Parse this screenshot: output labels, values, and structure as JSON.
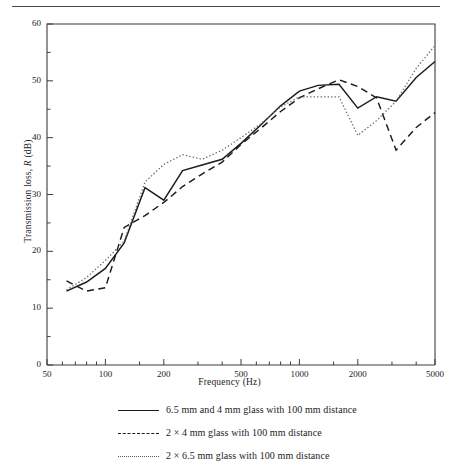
{
  "figure": {
    "has_top_rule": true
  },
  "chart_data": {
    "type": "line",
    "title": "",
    "xlabel": "Frequency (Hz)",
    "ylabel": "Transmission loss, R (dB)",
    "xscale": "log",
    "xlim": [
      50,
      5000
    ],
    "ylim": [
      0,
      60
    ],
    "grid": false,
    "legend_position": "below",
    "xticks": [
      50,
      100,
      200,
      500,
      1000,
      2000,
      5000
    ],
    "xtick_labels": [
      "50",
      "100",
      "200",
      "500",
      "1000",
      "2000",
      "5000"
    ],
    "xminor_ticks": [
      60,
      70,
      80,
      90,
      150,
      300,
      400,
      600,
      700,
      800,
      900,
      1500,
      3000,
      4000
    ],
    "yticks": [
      0,
      10,
      20,
      30,
      40,
      50,
      60
    ],
    "ytick_labels": [
      "0",
      "10",
      "20",
      "30",
      "40",
      "50",
      "60"
    ],
    "yminor_ticks": [
      5,
      15,
      25,
      35,
      45,
      55
    ],
    "x": [
      63,
      80,
      100,
      125,
      160,
      200,
      250,
      315,
      400,
      500,
      630,
      800,
      1000,
      1250,
      1600,
      2000,
      2500,
      3150,
      4000,
      5000
    ],
    "series": [
      {
        "name": "6.5 mm and 4 mm glass with 100 mm distance",
        "style": "solid",
        "color": "#1b1b1b",
        "values": [
          13.0,
          14.6,
          17.0,
          21.5,
          31.2,
          29.0,
          34.2,
          35.2,
          36.2,
          39.0,
          42.2,
          45.6,
          48.2,
          49.2,
          49.4,
          45.2,
          47.2,
          46.4,
          50.6,
          53.4
        ]
      },
      {
        "name": "2 × 4 mm glass with 100 mm distance",
        "style": "dashed",
        "color": "#1b1b1b",
        "values": [
          14.8,
          13.0,
          13.6,
          24.2,
          26.3,
          28.6,
          31.4,
          33.6,
          35.7,
          38.8,
          41.6,
          44.6,
          47.0,
          48.6,
          50.2,
          49.0,
          47.0,
          37.8,
          41.8,
          44.4
        ]
      },
      {
        "name": "2 × 6.5 mm glass with 100 mm distance",
        "style": "dotted",
        "color": "#6a6a6a",
        "values": [
          13.2,
          15.4,
          18.4,
          21.8,
          32.2,
          35.3,
          37.0,
          36.2,
          37.8,
          40.0,
          42.4,
          45.4,
          47.2,
          47.2,
          47.2,
          40.4,
          43.0,
          46.4,
          52.2,
          56.2
        ]
      }
    ]
  },
  "legend": {
    "items": [
      {
        "label": "6.5 mm and 4 mm glass with 100 mm distance",
        "style": "solid"
      },
      {
        "label": "2 × 4 mm glass with 100 mm distance",
        "style": "dashed"
      },
      {
        "label": "2 × 6.5 mm glass with 100 mm distance",
        "style": "dotted"
      }
    ]
  }
}
